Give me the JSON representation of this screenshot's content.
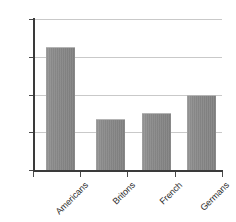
{
  "chart_data": {
    "type": "bar",
    "title": "",
    "subtitle": "",
    "xlabel": "",
    "ylabel": "",
    "categories": [
      "Americans",
      "Britons",
      "French",
      "Germans"
    ],
    "values": [
      65,
      27,
      30,
      40
    ],
    "value_suffix": "%",
    "ylim": [
      0,
      80
    ],
    "ytick_values": [
      0,
      20,
      40,
      60,
      80
    ],
    "ytick_labels": [
      "0%",
      "20%",
      "40%",
      "60%",
      "80%"
    ],
    "grid": true,
    "grid_axis": "y",
    "legend": false,
    "legend_position": "none",
    "colors": {
      "bar_fill": "#8a8a8a",
      "bar_top_edge": "#b4b4b4",
      "gridline": "#c9c9c9",
      "axis_line": "#3a3a3a",
      "tick_mark": "#4a4a4a",
      "text": "#2b2b2b",
      "background": "#ffffff"
    }
  }
}
